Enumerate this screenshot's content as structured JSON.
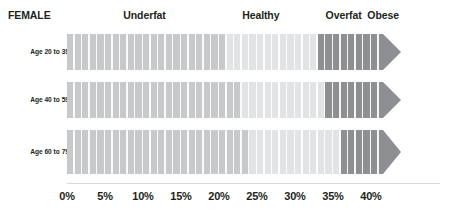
{
  "header": {
    "title": "FEMALE",
    "categories": [
      {
        "label": "Underfat",
        "center_pct": 10.2
      },
      {
        "label": "Healthy",
        "center_pct": 25.5
      },
      {
        "label": "Overfat",
        "center_pct": 36.4
      },
      {
        "label": "Obese",
        "center_pct": 41.6
      }
    ]
  },
  "chart_data": {
    "type": "bar",
    "title": "FEMALE",
    "xlabel": "",
    "ylabel": "",
    "xlim": [
      0,
      44
    ],
    "grid": false,
    "legend_position": "top",
    "categories": [
      "Age 20 to 39",
      "Age 40 to 59",
      "Age 60 to 79"
    ],
    "zone_names": [
      "Underfat",
      "Healthy",
      "Overfat",
      "Obese"
    ],
    "tick_labels": [
      "0%",
      "5%",
      "10%",
      "15%",
      "20%",
      "25%",
      "30%",
      "35%",
      "40%"
    ],
    "tick_values": [
      0,
      5,
      10,
      15,
      20,
      25,
      30,
      35,
      40
    ],
    "series": [
      {
        "name": "Age 20 to 39",
        "zones": [
          {
            "zone": "Underfat",
            "start": 0,
            "end": 21.0,
            "color": "#c8c9cb"
          },
          {
            "zone": "Healthy",
            "start": 21.0,
            "end": 33.0,
            "color": "#e2e3e5"
          },
          {
            "zone": "Overfat",
            "start": 33.0,
            "end": 39.0,
            "color": "#8d8f92"
          },
          {
            "zone": "Obese",
            "start": 39.0,
            "end": 44.0,
            "color": "#8d8f92"
          }
        ]
      },
      {
        "name": "Age 40 to 59",
        "zones": [
          {
            "zone": "Underfat",
            "start": 0,
            "end": 23.0,
            "color": "#c8c9cb"
          },
          {
            "zone": "Healthy",
            "start": 23.0,
            "end": 34.0,
            "color": "#e2e3e5"
          },
          {
            "zone": "Overfat",
            "start": 34.0,
            "end": 39.0,
            "color": "#8d8f92"
          },
          {
            "zone": "Obese",
            "start": 39.0,
            "end": 44.0,
            "color": "#8d8f92"
          }
        ]
      },
      {
        "name": "Age 60 to 79",
        "zones": [
          {
            "zone": "Underfat",
            "start": 0,
            "end": 24.0,
            "color": "#c8c9cb"
          },
          {
            "zone": "Healthy",
            "start": 24.0,
            "end": 36.0,
            "color": "#e2e3e5"
          },
          {
            "zone": "Overfat",
            "start": 36.0,
            "end": 39.5,
            "color": "#8d8f92"
          },
          {
            "zone": "Obese",
            "start": 39.5,
            "end": 44.0,
            "color": "#8d8f92"
          }
        ]
      }
    ]
  },
  "colors": {
    "background": "#ffffff",
    "text": "#231f20",
    "underfat": "#c8c9cb",
    "healthy": "#e2e3e5",
    "overfat": "#8d8f92",
    "obese": "#8d8f92",
    "axis_rule": "#d9d9d9"
  },
  "geometry": {
    "bar_left_px": 67,
    "px_per_pct": 7.6,
    "arrow_width_px": 18,
    "rows": [
      {
        "top": 34,
        "height": 36
      },
      {
        "top": 82,
        "height": 36
      },
      {
        "top": 130,
        "height": 44
      }
    ]
  }
}
